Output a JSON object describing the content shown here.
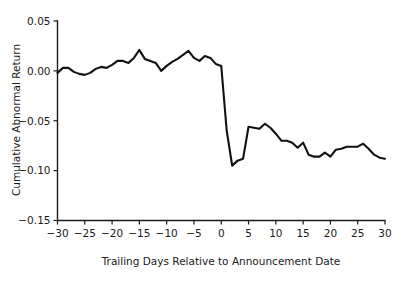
{
  "chart_data": {
    "type": "line",
    "title": "",
    "subtitle": "",
    "xlabel": "Trailing Days Relative to Announcement Date",
    "ylabel": "Cumulative Abnormal Return",
    "xlim": [
      -30,
      30
    ],
    "ylim": [
      -0.15,
      0.05
    ],
    "grid": false,
    "legend": null,
    "xticks": [
      -30,
      -25,
      -20,
      -15,
      -10,
      -5,
      0,
      5,
      10,
      15,
      20,
      25,
      30
    ],
    "xtick_labels": [
      "-30",
      "-25",
      "-20",
      "-15",
      "-10",
      "-5",
      "0",
      "5",
      "10",
      "15",
      "20",
      "25",
      "30"
    ],
    "yticks": [
      0.05,
      0.0,
      -0.05,
      -0.1,
      -0.15
    ],
    "ytick_labels": [
      "0.05",
      "0.00",
      "-0.05",
      "-0.10",
      "-0.15"
    ],
    "series": [
      {
        "name": "Cumulative Abnormal Return",
        "color": "#111111",
        "x": [
          -30,
          -29,
          -28,
          -27,
          -26,
          -25,
          -24,
          -23,
          -22,
          -21,
          -20,
          -19,
          -18,
          -17,
          -16,
          -15,
          -14,
          -13,
          -12,
          -11,
          -10,
          -9,
          -8,
          -7,
          -6,
          -5,
          -4,
          -3,
          -2,
          -1,
          0,
          1,
          2,
          3,
          4,
          5,
          6,
          7,
          8,
          9,
          10,
          11,
          12,
          13,
          14,
          15,
          16,
          17,
          18,
          19,
          20,
          21,
          22,
          23,
          24,
          25,
          26,
          27,
          28,
          29,
          30
        ],
        "values": [
          -0.002,
          0.003,
          0.003,
          -0.001,
          -0.003,
          -0.004,
          -0.002,
          0.002,
          0.004,
          0.003,
          0.006,
          0.01,
          0.01,
          0.008,
          0.013,
          0.021,
          0.012,
          0.01,
          0.008,
          0.0,
          0.005,
          0.009,
          0.012,
          0.016,
          0.02,
          0.013,
          0.01,
          0.015,
          0.013,
          0.007,
          0.005,
          -0.06,
          -0.095,
          -0.09,
          -0.088,
          -0.056,
          -0.057,
          -0.058,
          -0.053,
          -0.057,
          -0.063,
          -0.07,
          -0.07,
          -0.072,
          -0.077,
          -0.072,
          -0.084,
          -0.086,
          -0.086,
          -0.082,
          -0.086,
          -0.079,
          -0.078,
          -0.076,
          -0.076,
          -0.076,
          -0.073,
          -0.078,
          -0.084,
          -0.087,
          -0.088
        ]
      }
    ]
  },
  "axes": {
    "y_label": "Cumulative Abnormal Return",
    "x_label": "Trailing Days Relative to Announcement Date"
  }
}
